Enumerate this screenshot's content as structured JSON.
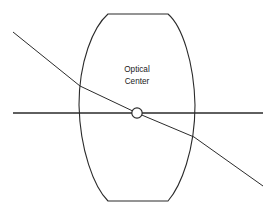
{
  "diagram": {
    "background_color": "#ffffff",
    "stroke_color": "#2b2b2b",
    "label": {
      "line1": "Optical",
      "line2": "Center",
      "x": 137,
      "y_line1": 72,
      "y_line2": 84
    },
    "canvas": {
      "width": 277,
      "height": 212
    },
    "lens": {
      "name": "biconvex-lens",
      "left_vertex_x": 79,
      "right_vertex_x": 195,
      "top_y": 14,
      "bottom_y": 201,
      "flat_left_x": 108,
      "flat_right_x": 168,
      "path": "M 108 14 L 168 14 C 182 26 194 62 195 105 C 195 150 181 186 168 201 L 108 201 C 94 187 80 150 79 105 C 79 62 93 27 108 14 Z"
    },
    "principal_axis": {
      "name": "principal-axis",
      "x1": 13,
      "y1": 113,
      "x2": 263,
      "y2": 113
    },
    "ray": {
      "name": "chief-ray",
      "points": [
        {
          "x": 13,
          "y": 32
        },
        {
          "x": 80,
          "y": 86
        },
        {
          "x": 137,
          "y": 113
        },
        {
          "x": 194,
          "y": 137
        },
        {
          "x": 263,
          "y": 186
        }
      ],
      "entry_x": 80,
      "entry_y": 86,
      "exit_x": 194,
      "exit_y": 137
    },
    "optical_center": {
      "name": "optical-center-marker",
      "cx": 137,
      "cy": 113,
      "r": 5.2
    }
  }
}
